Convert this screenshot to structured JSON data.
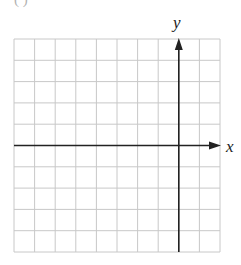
{
  "figure": {
    "fragment_text": "( )",
    "x_axis_label": "x",
    "y_axis_label": "y",
    "grid": {
      "columns": 10,
      "rows": 10,
      "left": 14,
      "top": 39,
      "right": 220,
      "bottom": 252,
      "line_color": "#c8c8c8",
      "axis_color": "#222222"
    },
    "axes": {
      "x_axis_row_index": 5,
      "y_axis_column_index": 8
    }
  }
}
